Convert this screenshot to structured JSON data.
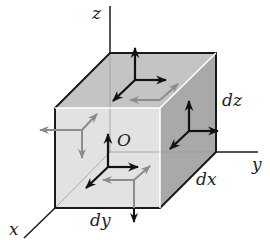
{
  "diagram": {
    "labels": {
      "z_axis": "z",
      "y_axis": "y",
      "x_axis": "x",
      "origin": "O",
      "dz": "dz",
      "dx": "dx",
      "dy": "dy"
    },
    "colors": {
      "edge": "#1a1a1a",
      "top_face": "#c4c4c4",
      "front_face": "#e2e2e2",
      "side_face": "#a9a9a9",
      "visible_arrow": "#111111",
      "hidden_arrow": "#8c8c8c"
    }
  }
}
